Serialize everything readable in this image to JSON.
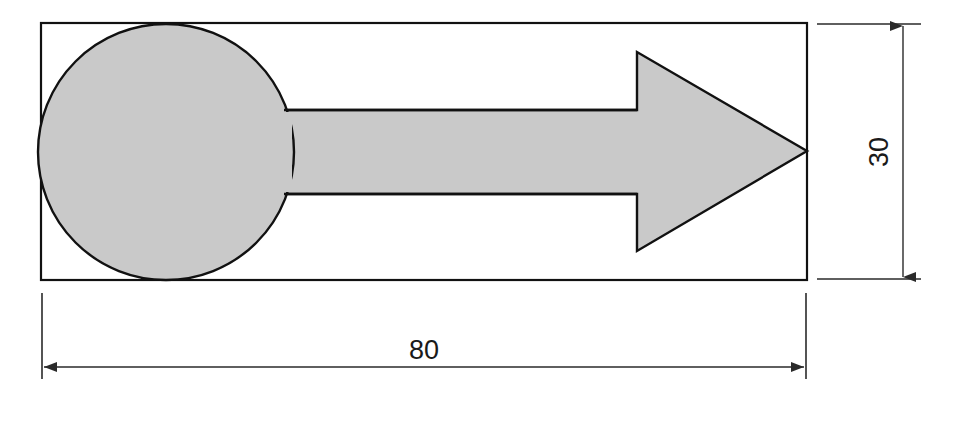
{
  "drawing": {
    "title": "Arrow with circular tail — dimensioned technical drawing",
    "background_color": "#ffffff",
    "outline_color": "#111111",
    "fill_color": "#c9c9c9",
    "dimension_line_color": "#2a2a2a",
    "bounding_box": {
      "label": "bounding-rectangle",
      "x": 41,
      "y": 23,
      "width": 766,
      "height": 257
    },
    "shapes": [
      {
        "name": "circle-tail",
        "type": "circle",
        "cx": 166,
        "cy": 152,
        "r": 128
      },
      {
        "name": "arrow-body",
        "type": "polygon",
        "points": "290,110 637,110 637,52 807,151 637,251 637,194 290,194"
      }
    ],
    "dimensions": [
      {
        "name": "width-dimension",
        "value": "80",
        "orientation": "horizontal",
        "text_x": 424,
        "text_y": 359,
        "line_y": 367,
        "from_x": 41,
        "to_x": 807,
        "extension_top_y": 293,
        "extension_bottom_y": 379
      },
      {
        "name": "height-dimension",
        "value": "30",
        "orientation": "vertical",
        "text_x": 879,
        "text_y": 152,
        "line_x": 903,
        "from_y": 23,
        "to_y": 280,
        "extension_left_x": 817,
        "extension_right_x": 921
      }
    ]
  }
}
